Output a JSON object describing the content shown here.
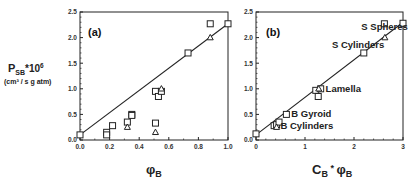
{
  "chart_data": [
    {
      "type": "scatter",
      "panel_label": "(a)",
      "xlabel": "φ",
      "xlabel_sub": "B",
      "ylabel": "P",
      "ylabel_sub": "SB",
      "ylabel_sup_prefix": "*10",
      "ylabel_exp": "6",
      "ylabel_units": "(cm³ / s g atm)",
      "xlim": [
        0.0,
        1.0
      ],
      "ylim": [
        0.0,
        2.5
      ],
      "xticks": [
        "0.0",
        "0.2",
        "0.4",
        "0.6",
        "0.8",
        "1.0"
      ],
      "xtick_values": [
        0.0,
        0.2,
        0.4,
        0.6,
        0.8,
        1.0
      ],
      "yticks": [
        "0.0",
        "0.5",
        "1.0",
        "1.5",
        "2.0",
        "2.5"
      ],
      "ytick_values": [
        0.0,
        0.5,
        1.0,
        1.5,
        2.0,
        2.5
      ],
      "series": [
        {
          "name": "squares",
          "marker": "square",
          "points": [
            [
              0.0,
              0.1
            ],
            [
              0.18,
              0.15
            ],
            [
              0.18,
              0.1
            ],
            [
              0.22,
              0.28
            ],
            [
              0.32,
              0.35
            ],
            [
              0.35,
              0.5
            ],
            [
              0.35,
              0.48
            ],
            [
              0.51,
              0.95
            ],
            [
              0.53,
              0.85
            ],
            [
              0.55,
              0.95
            ],
            [
              0.51,
              0.33
            ],
            [
              0.73,
              1.7
            ],
            [
              0.88,
              2.27
            ],
            [
              1.0,
              2.27
            ]
          ]
        },
        {
          "name": "triangles",
          "marker": "triangle",
          "points": [
            [
              0.32,
              0.25
            ],
            [
              0.51,
              0.15
            ],
            [
              0.55,
              1.0
            ],
            [
              0.88,
              2.0
            ]
          ]
        }
      ],
      "fit_line": [
        [
          0.0,
          0.1
        ],
        [
          1.0,
          2.27
        ]
      ]
    },
    {
      "type": "scatter",
      "panel_label": "(b)",
      "xlabel": "C",
      "xlabel_sub": "B",
      "xlabel_mid": " * ",
      "xlabel2": "φ",
      "xlabel2_sub": "B",
      "xlim": [
        0,
        3
      ],
      "ylim": [
        0.0,
        2.5
      ],
      "xticks": [
        "0",
        "1",
        "2",
        "3"
      ],
      "xtick_values": [
        0,
        1,
        2,
        3
      ],
      "yticks": [
        "0.0",
        "0.5",
        "1.0",
        "1.5",
        "2.0",
        "2.5"
      ],
      "ytick_values": [
        0.0,
        0.5,
        1.0,
        1.5,
        2.0,
        2.5
      ],
      "series": [
        {
          "name": "squares",
          "marker": "square",
          "points": [
            [
              0.0,
              0.12
            ],
            [
              0.37,
              0.28
            ],
            [
              0.42,
              0.3
            ],
            [
              0.47,
              0.35
            ],
            [
              0.62,
              0.5
            ],
            [
              1.22,
              0.97
            ],
            [
              1.27,
              0.85
            ],
            [
              1.32,
              1.0
            ],
            [
              2.2,
              1.7
            ],
            [
              2.62,
              2.27
            ],
            [
              3.0,
              2.28
            ]
          ]
        },
        {
          "name": "triangles",
          "marker": "triangle",
          "points": [
            [
              0.42,
              0.25
            ],
            [
              1.28,
              1.0
            ],
            [
              2.63,
              2.0
            ]
          ]
        }
      ],
      "fit_line": [
        [
          0.0,
          0.1
        ],
        [
          3.0,
          2.3
        ]
      ],
      "annotations": [
        {
          "text": "S Spheres",
          "x": 2.15,
          "y": 2.15
        },
        {
          "text": "S Cylinders",
          "x": 1.55,
          "y": 1.8
        },
        {
          "text": "Lamella",
          "x": 1.42,
          "y": 0.93
        },
        {
          "text": "B Gyroid",
          "x": 0.72,
          "y": 0.45
        },
        {
          "text": "B Cylinders",
          "x": 0.5,
          "y": 0.22
        }
      ]
    }
  ]
}
